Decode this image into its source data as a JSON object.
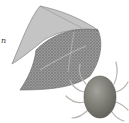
{
  "image": {
    "description": "Engraved illustration of a curled leaf with stippled texture and a mite (tick-like arachnid) below right",
    "text_fragment": "n"
  },
  "colors": {
    "leaf_dark": "#6f6f6f",
    "leaf_light": "#bdbdbd",
    "mite_body": "#7a7a72",
    "mite_legs": "#b5b5b0"
  }
}
